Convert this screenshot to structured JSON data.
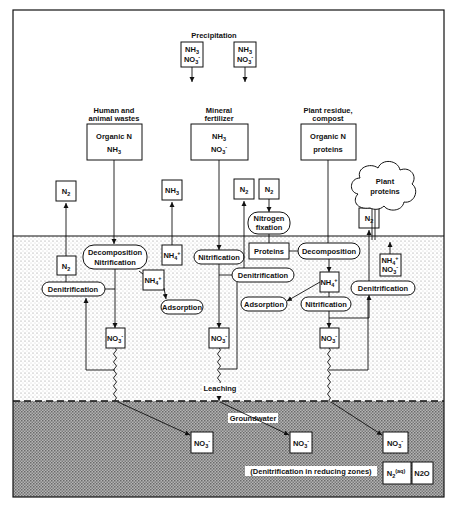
{
  "zones": {
    "surface": "Above ground",
    "soil": "Soil zone",
    "groundwater_label": "Groundwater",
    "leaching_label": "Leaching"
  },
  "colors": {
    "ink": "#111111",
    "soil_dots": "#8a8a8a",
    "groundwater_fill": "#9a9a9a"
  },
  "precipitation": {
    "label": "Precipitation",
    "box1": {
      "line1": "NH3",
      "line2": "NO3-"
    },
    "box2": {
      "line1": "NH3",
      "line2": "NO3-"
    }
  },
  "sources": [
    {
      "heading1": "Human and",
      "heading2": "animal wastes",
      "line1": "Organic N",
      "line2": "NH3"
    },
    {
      "heading1": "Mineral",
      "heading2": "fertilizer",
      "line1": "NH3",
      "line2": "NO3-"
    },
    {
      "heading1": "Plant residue,",
      "heading2": "compost",
      "line1": "Organic N",
      "line2": "proteins"
    }
  ],
  "atmosphere_boxes": {
    "n2_left": "N2",
    "nh3_mid": "NH3",
    "n2_mid": "N2",
    "n2_fix": "N2",
    "n2_right": "N2"
  },
  "plant": {
    "line1": "Plant",
    "line2": "proteins"
  },
  "processes": {
    "nitrogen_fixation1": "Nitrogen",
    "nitrogen_fixation2": "fixation",
    "decomp_nitr1": "Decomposition",
    "decomp_nitr2": "Nitrification",
    "denitrification_left": "Denitrification",
    "adsorption_left": "Adsorption",
    "nitrification_mid": "Nitrification",
    "proteins": "Proteins",
    "decomposition_right": "Decomposition",
    "denitrification_mid": "Denitrification",
    "adsorption_mid": "Adsorption",
    "nitrification_right": "Nitrification",
    "denitrification_right": "Denitrification"
  },
  "soil_boxes": {
    "n2_soil_left": "N2",
    "nh4_mid": "NH4+",
    "nh4_left": "NH4+",
    "nh4_right": "NH4+",
    "plant_uptake1": "NH4+",
    "plant_uptake2": "NO3-",
    "no3_left": "NO3-",
    "no3_mid": "NO3-",
    "no3_right": "NO3-"
  },
  "groundwater": {
    "no3_1": "NO3-",
    "no3_2": "NO3-",
    "no3_3": "NO3-",
    "reducing_note": "(Denitrification in reducing zones)",
    "n2aq": "N2(aq)",
    "n2o": "N2O"
  }
}
